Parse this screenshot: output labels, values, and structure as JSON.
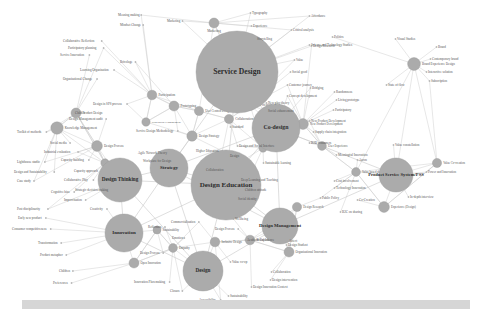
{
  "figure": {
    "type": "network-graph",
    "background_color": "#ffffff",
    "node_color": "#ababab",
    "edge_color": "#c9c9c9",
    "label_color": "#2b2b2b",
    "leaf_label_color": "#555555",
    "footer_bar_color": "#d6d6d6"
  },
  "chart_data": {
    "type": "network",
    "grid": false,
    "legend": "none",
    "node_count": 9,
    "leaf_count": 118,
    "hubs": [
      {
        "id": "service-design",
        "label": "Service Design",
        "x": 237,
        "y": 72,
        "r": 41,
        "font": 7.6
      },
      {
        "id": "design-education",
        "label": "Design Education",
        "x": 226,
        "y": 185,
        "r": 35,
        "font": 7.0
      },
      {
        "id": "co-design",
        "label": "Co-design",
        "x": 276,
        "y": 128,
        "r": 24,
        "font": 5.8
      },
      {
        "id": "design-thinking",
        "label": "Design Thinking",
        "x": 120,
        "y": 180,
        "r": 22,
        "font": 5.2
      },
      {
        "id": "strategy",
        "label": "Strategy",
        "x": 169,
        "y": 168,
        "r": 19,
        "font": 5.0
      },
      {
        "id": "innovation",
        "label": "Innovation",
        "x": 124,
        "y": 233,
        "r": 19,
        "font": 5.0
      },
      {
        "id": "design",
        "label": "Design",
        "x": 203,
        "y": 271,
        "r": 20,
        "font": 5.2
      },
      {
        "id": "design-management",
        "label": "Design Management",
        "x": 280,
        "y": 226,
        "r": 18,
        "font": 4.8
      },
      {
        "id": "product-service-system",
        "label": "Product Service System/PSS",
        "x": 396,
        "y": 175,
        "r": 17,
        "font": 4.6
      }
    ],
    "mid_nodes": [
      {
        "id": "marketing",
        "label": "Marketing",
        "x": 214,
        "y": 23,
        "r": 5.0,
        "font": 3.3,
        "anchor": "below"
      },
      {
        "id": "co-creation",
        "label": "Co-creation",
        "x": 250,
        "y": 105,
        "r": 5.2,
        "font": 3.3,
        "anchor": "right"
      },
      {
        "id": "collaboration",
        "label": "Collaboration",
        "x": 229,
        "y": 119,
        "r": 4.6,
        "font": 3.3,
        "anchor": "right"
      },
      {
        "id": "participation",
        "label": "Participation",
        "x": 152,
        "y": 95,
        "r": 4.8,
        "font": 3.3,
        "anchor": "right"
      },
      {
        "id": "prototyping",
        "label": "Prototyping",
        "x": 174,
        "y": 106,
        "r": 5.0,
        "font": 3.3,
        "anchor": "right"
      },
      {
        "id": "user-centred-design",
        "label": "User Centred Design",
        "x": 199,
        "y": 111,
        "r": 4.6,
        "font": 3.0,
        "anchor": "right"
      },
      {
        "id": "design-strategy",
        "label": "Design Strategy",
        "x": 192,
        "y": 136,
        "r": 5.2,
        "font": 3.2,
        "anchor": "right"
      },
      {
        "id": "stakeholder-engagement",
        "label": "Stakeholder Engagement",
        "x": 146,
        "y": 122,
        "r": 4.2,
        "font": 2.9,
        "anchor": "right"
      },
      {
        "id": "knowledge-management",
        "label": "Knowledge Management",
        "x": 57,
        "y": 128,
        "r": 6.2,
        "font": 3.2,
        "anchor": "right"
      },
      {
        "id": "product-design",
        "label": "Product Design",
        "x": 76,
        "y": 113,
        "r": 5.0,
        "font": 3.2,
        "anchor": "right"
      },
      {
        "id": "design-process",
        "label": "Design Process",
        "x": 97,
        "y": 146,
        "r": 5.4,
        "font": 3.2,
        "anchor": "right"
      },
      {
        "id": "co-creation-2",
        "label": "Creativity",
        "x": 105,
        "y": 163,
        "r": 4.2,
        "font": 3.0,
        "anchor": "right"
      },
      {
        "id": "brand-experience",
        "label": "Brand Experience Design",
        "x": 414,
        "y": 64,
        "r": 6.4,
        "font": 3.2,
        "anchor": "right"
      },
      {
        "id": "new-product-dev",
        "label": "New Product Development",
        "x": 303,
        "y": 124,
        "r": 5.4,
        "font": 3.0,
        "anchor": "right"
      },
      {
        "id": "value-based-design",
        "label": "Value based design",
        "x": 356,
        "y": 172,
        "r": 4.4,
        "font": 3.0,
        "anchor": "right"
      },
      {
        "id": "experience-design",
        "label": "Experience (Design)",
        "x": 384,
        "y": 207,
        "r": 5.4,
        "font": 3.0,
        "anchor": "right"
      },
      {
        "id": "value-co-creation",
        "label": "Value Co-creation",
        "x": 437,
        "y": 163,
        "r": 4.6,
        "font": 3.0,
        "anchor": "right"
      },
      {
        "id": "design-research",
        "label": "Design Research",
        "x": 297,
        "y": 207,
        "r": 4.6,
        "font": 3.0,
        "anchor": "right"
      },
      {
        "id": "organisational-innov",
        "label": "Organisational Innovation",
        "x": 289,
        "y": 252,
        "r": 5.0,
        "font": 3.0,
        "anchor": "right"
      },
      {
        "id": "inclusive-design",
        "label": "Inclusive Design",
        "x": 215,
        "y": 242,
        "r": 4.8,
        "font": 3.0,
        "anchor": "right"
      },
      {
        "id": "social-innovation",
        "label": "Social Innovation",
        "x": 250,
        "y": 240,
        "r": 4.8,
        "font": 3.0,
        "anchor": "right"
      },
      {
        "id": "open-innovation",
        "label": "Open Innovation",
        "x": 134,
        "y": 263,
        "r": 5.0,
        "font": 3.0,
        "anchor": "right"
      },
      {
        "id": "empathy",
        "label": "Empathy",
        "x": 173,
        "y": 248,
        "r": 4.4,
        "font": 3.0,
        "anchor": "right"
      },
      {
        "id": "sustainability-node",
        "label": "Sustainability",
        "x": 157,
        "y": 230,
        "r": 4.0,
        "font": 3.0,
        "anchor": "right"
      },
      {
        "id": "design-fiction",
        "label": "Design Fiction",
        "x": 263,
        "y": 148,
        "r": 4.2,
        "font": 3.0,
        "anchor": "right"
      },
      {
        "id": "user-experience",
        "label": "User Experience",
        "x": 322,
        "y": 146,
        "r": 4.4,
        "font": 3.0,
        "anchor": "right"
      }
    ],
    "leaf_labels": [
      {
        "label": "Meaning making",
        "x": 118,
        "y": 15,
        "align": "start"
      },
      {
        "label": "Typography",
        "x": 252,
        "y": 13,
        "align": "start"
      },
      {
        "label": "Affordance",
        "x": 311,
        "y": 16,
        "align": "start"
      },
      {
        "label": "Marketing",
        "x": 167,
        "y": 21,
        "align": "start"
      },
      {
        "label": "Mindset Change",
        "x": 120,
        "y": 25,
        "align": "start"
      },
      {
        "label": "Experience",
        "x": 253,
        "y": 26,
        "align": "start"
      },
      {
        "label": "Critical analysis",
        "x": 293,
        "y": 30,
        "align": "start"
      },
      {
        "label": "Collaborative Reflection",
        "x": 63,
        "y": 41,
        "align": "start"
      },
      {
        "label": "Storytelling",
        "x": 257,
        "y": 39,
        "align": "start"
      },
      {
        "label": "Politics",
        "x": 334,
        "y": 37,
        "align": "start"
      },
      {
        "label": "Visual Studies",
        "x": 397,
        "y": 39,
        "align": "start"
      },
      {
        "label": "Participatory planning",
        "x": 68,
        "y": 48,
        "align": "start"
      },
      {
        "label": "Design Research",
        "x": 313,
        "y": 46,
        "align": "start"
      },
      {
        "label": "Science and Technology Studies",
        "x": 311,
        "y": 45,
        "align": "start"
      },
      {
        "label": "Brand",
        "x": 438,
        "y": 47,
        "align": "start"
      },
      {
        "label": "Service Innovation",
        "x": 60,
        "y": 55,
        "align": "start"
      },
      {
        "label": "Value",
        "x": 296,
        "y": 60,
        "align": "start"
      },
      {
        "label": "Contemporary brand",
        "x": 432,
        "y": 59,
        "align": "start"
      },
      {
        "label": "Bricolage",
        "x": 120,
        "y": 62,
        "align": "start"
      },
      {
        "label": "Social good",
        "x": 292,
        "y": 72,
        "align": "start"
      },
      {
        "label": "Learning Organisation",
        "x": 80,
        "y": 70,
        "align": "start"
      },
      {
        "label": "Interactive solution",
        "x": 428,
        "y": 72,
        "align": "start"
      },
      {
        "label": "Organisational Change",
        "x": 63,
        "y": 79,
        "align": "start"
      },
      {
        "label": "Customer journey",
        "x": 289,
        "y": 85,
        "align": "start"
      },
      {
        "label": "State of flow",
        "x": 388,
        "y": 85,
        "align": "start"
      },
      {
        "label": "Bridging",
        "x": 312,
        "y": 88,
        "align": "start"
      },
      {
        "label": "Randomness",
        "x": 336,
        "y": 92,
        "align": "start"
      },
      {
        "label": "Design in SPS process",
        "x": 93,
        "y": 104,
        "align": "start"
      },
      {
        "label": "Living prototype",
        "x": 338,
        "y": 100,
        "align": "start"
      },
      {
        "label": "Concept development",
        "x": 289,
        "y": 96,
        "align": "start"
      },
      {
        "label": "Child",
        "x": 75,
        "y": 113,
        "align": "start"
      },
      {
        "label": "Participatory",
        "x": 335,
        "y": 110,
        "align": "start"
      },
      {
        "label": "Design Management audit",
        "x": 69,
        "y": 119,
        "align": "start"
      },
      {
        "label": "New play theory",
        "x": 268,
        "y": 103,
        "align": "start"
      },
      {
        "label": "Social enhancement",
        "x": 268,
        "y": 111,
        "align": "start"
      },
      {
        "label": "New Product Development",
        "x": 311,
        "y": 121,
        "align": "start"
      },
      {
        "label": "Toolkit of methods",
        "x": 17,
        "y": 132,
        "align": "start"
      },
      {
        "label": "Service Design Methodology",
        "x": 136,
        "y": 131,
        "align": "start"
      },
      {
        "label": "Supply chain integration",
        "x": 315,
        "y": 132,
        "align": "start"
      },
      {
        "label": "Standard",
        "x": 232,
        "y": 127,
        "align": "start"
      },
      {
        "label": "Social media",
        "x": 50,
        "y": 143,
        "align": "start"
      },
      {
        "label": "B2B consumers",
        "x": 311,
        "y": 143,
        "align": "start"
      },
      {
        "label": "Meaningful Innovation",
        "x": 338,
        "y": 155,
        "align": "start"
      },
      {
        "label": "Industrial evaluation",
        "x": 44,
        "y": 152,
        "align": "start"
      },
      {
        "label": "Agile Network Theory",
        "x": 138,
        "y": 153,
        "align": "start"
      },
      {
        "label": "Higher Education",
        "x": 196,
        "y": 151,
        "align": "start"
      },
      {
        "label": "Design and Social Interface",
        "x": 239,
        "y": 146,
        "align": "start"
      },
      {
        "label": "Design",
        "x": 230,
        "y": 156,
        "align": "start"
      },
      {
        "label": "Aaron",
        "x": 359,
        "y": 160,
        "align": "start"
      },
      {
        "label": "Lighthouse studio",
        "x": 17,
        "y": 162,
        "align": "start"
      },
      {
        "label": "Capacity building",
        "x": 61,
        "y": 160,
        "align": "start"
      },
      {
        "label": "Workplace for Design",
        "x": 143,
        "y": 161,
        "align": "start"
      },
      {
        "label": "Sustainable learning",
        "x": 265,
        "y": 163,
        "align": "start"
      },
      {
        "label": "Value constellation",
        "x": 395,
        "y": 145,
        "align": "start"
      },
      {
        "label": "Design and Sustainability",
        "x": 14,
        "y": 172,
        "align": "start"
      },
      {
        "label": "Capacity approach",
        "x": 74,
        "y": 171,
        "align": "start"
      },
      {
        "label": "Collaboration",
        "x": 206,
        "y": 170,
        "align": "start"
      },
      {
        "label": "Deep Learning and Teaching",
        "x": 241,
        "y": 180,
        "align": "start"
      },
      {
        "label": "Power and Innovation",
        "x": 428,
        "y": 172,
        "align": "start"
      },
      {
        "label": "Case study",
        "x": 17,
        "y": 181,
        "align": "start"
      },
      {
        "label": "Collaborative Play",
        "x": 64,
        "y": 180,
        "align": "start"
      },
      {
        "label": "Children attitude",
        "x": 245,
        "y": 190,
        "align": "start"
      },
      {
        "label": "Cost involvement",
        "x": 336,
        "y": 181,
        "align": "start"
      },
      {
        "label": "Technology Innovation",
        "x": 336,
        "y": 188,
        "align": "start"
      },
      {
        "label": "Strategic decision making",
        "x": 75,
        "y": 190,
        "align": "start"
      },
      {
        "label": "Social identity",
        "x": 238,
        "y": 199,
        "align": "start"
      },
      {
        "label": "Public Policy",
        "x": 322,
        "y": 198,
        "align": "start"
      },
      {
        "label": "Cognitive bias",
        "x": 51,
        "y": 192,
        "align": "start"
      },
      {
        "label": "In-depth interview",
        "x": 410,
        "y": 197,
        "align": "start"
      },
      {
        "label": "Improvisation",
        "x": 64,
        "y": 200,
        "align": "start"
      },
      {
        "label": "Post disciplinarity",
        "x": 17,
        "y": 209,
        "align": "start"
      },
      {
        "label": "Creativity",
        "x": 90,
        "y": 209,
        "align": "start"
      },
      {
        "label": "Early new product",
        "x": 18,
        "y": 218,
        "align": "start"
      },
      {
        "label": "B2C on sharing",
        "x": 342,
        "y": 212,
        "align": "start"
      },
      {
        "label": "Co-Creation",
        "x": 359,
        "y": 200,
        "align": "start"
      },
      {
        "label": "Consumer competitiveness",
        "x": 12,
        "y": 229,
        "align": "start"
      },
      {
        "label": "Reflection",
        "x": 148,
        "y": 227,
        "align": "start"
      },
      {
        "label": "Commercialisation",
        "x": 171,
        "y": 222,
        "align": "start"
      },
      {
        "label": "Wellbeing",
        "x": 235,
        "y": 219,
        "align": "start"
      },
      {
        "label": "Design Process",
        "x": 215,
        "y": 229,
        "align": "start"
      },
      {
        "label": "Aesthetic Experience",
        "x": 247,
        "y": 240,
        "align": "start"
      },
      {
        "label": "Emotion",
        "x": 172,
        "y": 238,
        "align": "start"
      },
      {
        "label": "Transformation",
        "x": 38,
        "y": 243,
        "align": "start"
      },
      {
        "label": "Design Student",
        "x": 288,
        "y": 245,
        "align": "start"
      },
      {
        "label": "Affect",
        "x": 289,
        "y": 241,
        "align": "start"
      },
      {
        "label": "Product metaphor",
        "x": 40,
        "y": 255,
        "align": "start"
      },
      {
        "label": "Design Process",
        "x": 140,
        "y": 253,
        "align": "start"
      },
      {
        "label": "Value co-op",
        "x": 232,
        "y": 262,
        "align": "start"
      },
      {
        "label": "Children",
        "x": 59,
        "y": 271,
        "align": "start"
      },
      {
        "label": "Collaboration",
        "x": 273,
        "y": 272,
        "align": "start"
      },
      {
        "label": "Preferences",
        "x": 53,
        "y": 283,
        "align": "start"
      },
      {
        "label": "Innovation Placemaking",
        "x": 134,
        "y": 282,
        "align": "start"
      },
      {
        "label": "Design intervention",
        "x": 272,
        "y": 280,
        "align": "start"
      },
      {
        "label": "Design Innovation Context",
        "x": 253,
        "y": 287,
        "align": "start"
      },
      {
        "label": "Closure",
        "x": 170,
        "y": 291,
        "align": "start"
      },
      {
        "label": "Sustainability",
        "x": 230,
        "y": 296,
        "align": "start"
      },
      {
        "label": "Accessibility",
        "x": 199,
        "y": 300,
        "align": "start"
      },
      {
        "label": "Subscription",
        "x": 431,
        "y": 81,
        "align": "start"
      }
    ]
  }
}
